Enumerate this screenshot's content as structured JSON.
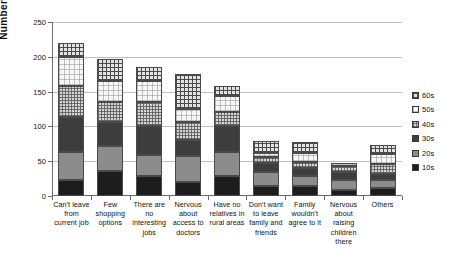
{
  "chart_data": {
    "type": "bar",
    "stacked": true,
    "title": "",
    "xlabel": "",
    "ylabel": "Number of answers",
    "ylim": [
      0,
      250
    ],
    "ytick_values": [
      0,
      50,
      100,
      150,
      200,
      250
    ],
    "ytick_labels": [
      "0",
      "50",
      "100",
      "150",
      "200",
      "250"
    ],
    "grid": "horizontal",
    "legend_position": "right",
    "legend_title": "",
    "categories": [
      "Can't leave from current job",
      "Few shopping options",
      "There are no interesting jobs",
      "Nervous about access to doctors",
      "Have no relatives in rural areas",
      "Don't want to leave family and friends",
      "Family wouldn't agree to it",
      "Nervous about raising children there",
      "Others"
    ],
    "category_lines": [
      [
        "Can't leave",
        "from",
        "current job"
      ],
      [
        "Few",
        "shopping",
        "options"
      ],
      [
        "There are",
        "no",
        "interesting",
        "jobs"
      ],
      [
        "Nervous",
        "about",
        "access to",
        "doctors"
      ],
      [
        "Have no",
        "relatives in",
        "rural areas"
      ],
      [
        "Don't want",
        "to leave",
        "family and",
        "friends"
      ],
      [
        "Family",
        "wouldn't",
        "agree to it"
      ],
      [
        "Nervous",
        "about",
        "raising",
        "children",
        "there"
      ],
      [
        "Others"
      ]
    ],
    "series": [
      {
        "name": "10s",
        "values": [
          23,
          36,
          29,
          20,
          29,
          14,
          14,
          9,
          11
        ]
      },
      {
        "name": "20s",
        "values": [
          40,
          36,
          30,
          38,
          34,
          21,
          15,
          14,
          12
        ]
      },
      {
        "name": "30s",
        "values": [
          50,
          34,
          42,
          23,
          38,
          13,
          11,
          12,
          9
        ]
      },
      {
        "name": "40s",
        "values": [
          45,
          29,
          34,
          25,
          20,
          8,
          9,
          8,
          14
        ]
      },
      {
        "name": "50s",
        "values": [
          42,
          30,
          30,
          19,
          23,
          6,
          13,
          5,
          14
        ]
      },
      {
        "name": "60s",
        "values": [
          20,
          32,
          20,
          50,
          14,
          17,
          16,
          0,
          13
        ]
      }
    ],
    "totals": [
      220,
      197,
      185,
      175,
      158,
      79,
      78,
      48,
      73
    ],
    "series_fill": {
      "10s": "solid-black",
      "20s": "solid-medium-gray",
      "30s": "solid-dark-gray",
      "40s": "fine-checker-gray",
      "50s": "light-checker-white",
      "60s": "bold-grid-checker"
    }
  },
  "legend": {
    "items": [
      {
        "label": "60s",
        "fill": "f-60s"
      },
      {
        "label": "50s",
        "fill": "f-50s"
      },
      {
        "label": "40s",
        "fill": "f-40s"
      },
      {
        "label": "30s",
        "fill": "f-30s"
      },
      {
        "label": "20s",
        "fill": "f-20s"
      },
      {
        "label": "10s",
        "fill": "f-10s"
      }
    ]
  }
}
